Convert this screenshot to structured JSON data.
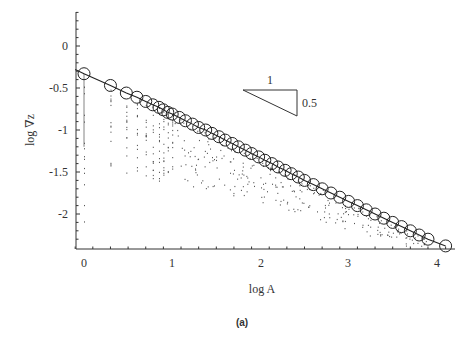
{
  "chart_data": {
    "type": "scatter",
    "title": "",
    "caption": "(a)",
    "xlabel": "log A",
    "ylabel": "log ∇z",
    "xlim": [
      -0.1,
      4.2
    ],
    "ylim": [
      -2.4,
      0.4
    ],
    "xticks": [
      "0",
      "1",
      "2",
      "3",
      "4"
    ],
    "yticks": [
      "0",
      "-0.5",
      "-1",
      "-1.5",
      "-2"
    ],
    "grid": false,
    "legend": null,
    "slope_triangle": {
      "run_label": "1",
      "rise_label": "0.5",
      "slope": -0.5
    },
    "series": [
      {
        "name": "binned mean (circles)",
        "style": "circles connected by line",
        "x": [
          0.0,
          0.3,
          0.48,
          0.6,
          0.7,
          0.78,
          0.85,
          0.9,
          0.95,
          1.0,
          1.08,
          1.15,
          1.23,
          1.3,
          1.38,
          1.45,
          1.53,
          1.6,
          1.68,
          1.75,
          1.83,
          1.9,
          1.98,
          2.05,
          2.13,
          2.2,
          2.28,
          2.35,
          2.43,
          2.5,
          2.6,
          2.7,
          2.8,
          2.9,
          3.0,
          3.1,
          3.2,
          3.3,
          3.4,
          3.5,
          3.6,
          3.7,
          3.8,
          3.9,
          4.1
        ],
        "y": [
          -0.33,
          -0.47,
          -0.56,
          -0.61,
          -0.66,
          -0.7,
          -0.73,
          -0.76,
          -0.79,
          -0.81,
          -0.85,
          -0.89,
          -0.93,
          -0.97,
          -1.0,
          -1.04,
          -1.08,
          -1.12,
          -1.16,
          -1.2,
          -1.24,
          -1.28,
          -1.32,
          -1.36,
          -1.4,
          -1.44,
          -1.48,
          -1.52,
          -1.56,
          -1.6,
          -1.65,
          -1.7,
          -1.75,
          -1.8,
          -1.85,
          -1.9,
          -1.95,
          -2.0,
          -2.05,
          -2.1,
          -2.15,
          -2.2,
          -2.25,
          -2.3,
          -2.38
        ]
      },
      {
        "name": "individual samples (dots)",
        "style": "small dots",
        "description": "scattered points below the mean line, spreading downward from each mean position"
      }
    ],
    "fit_line": {
      "x": [
        -0.1,
        4.1
      ],
      "y": [
        -0.28,
        -2.38
      ]
    }
  }
}
